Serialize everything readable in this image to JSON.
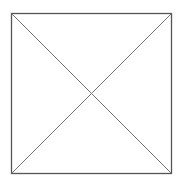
{
  "diagram": {
    "shape": "square",
    "diagonals": 2,
    "stroke_color": "#555555",
    "background_color": "#ffffff"
  }
}
